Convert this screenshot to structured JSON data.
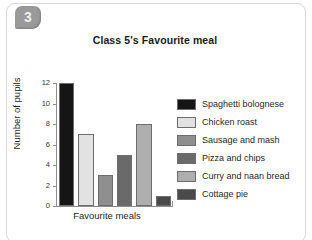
{
  "badge": {
    "number": "3"
  },
  "chart_data": {
    "type": "bar",
    "title": "Class 5's Favourite meal",
    "xlabel": "Favourite meals",
    "ylabel": "Number of pupils",
    "categories": [
      "Spaghetti bolognese",
      "Chicken roast",
      "Sausage and mash",
      "Pizza and chips",
      "Curry and naan bread",
      "Cottage pie"
    ],
    "values": [
      12,
      7,
      3,
      5,
      8,
      1
    ],
    "colors": [
      "#151515",
      "#e2e2e2",
      "#8f8f8f",
      "#6a6a6a",
      "#aeaeae",
      "#4a4a4a"
    ],
    "ylim": [
      0,
      12
    ],
    "yticks": [
      0,
      2,
      4,
      6,
      8,
      10,
      12
    ],
    "ytick_labels": [
      "0",
      "2",
      "4",
      "6",
      "8",
      "10",
      "12"
    ],
    "xtick_labels": [],
    "grid": false,
    "legend_position": "right",
    "legend": [
      {
        "label": "Spaghetti bolognese",
        "color": "#151515"
      },
      {
        "label": "Chicken roast",
        "color": "#e2e2e2"
      },
      {
        "label": "Sausage and mash",
        "color": "#8f8f8f"
      },
      {
        "label": "Pizza and chips",
        "color": "#6a6a6a"
      },
      {
        "label": "Curry and naan bread",
        "color": "#aeaeae"
      },
      {
        "label": "Cottage pie",
        "color": "#4a4a4a"
      }
    ]
  }
}
